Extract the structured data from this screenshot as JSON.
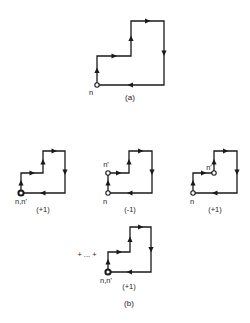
{
  "figure_a": {
    "caption": "(a)",
    "caption_pos": [
      130,
      100
    ],
    "path": [
      [
        97,
        85
      ],
      [
        97,
        56
      ],
      [
        131,
        56
      ],
      [
        131,
        21
      ],
      [
        164,
        21
      ],
      [
        164,
        85
      ],
      [
        97,
        85
      ]
    ],
    "nodes": [
      {
        "pos": [
          97,
          85
        ],
        "style": "normal",
        "label": "n",
        "label_pos": [
          91,
          95
        ]
      }
    ],
    "weight": null
  },
  "figure_b": {
    "caption": "(b)",
    "caption_pos": [
      129,
      306
    ],
    "ellipsis": "+ ... +",
    "ellipsis_pos": [
      87,
      257
    ],
    "panels": [
      {
        "path": [
          [
            21,
            193
          ],
          [
            21,
            173
          ],
          [
            43,
            173
          ],
          [
            43,
            151
          ],
          [
            65,
            151
          ],
          [
            65,
            193
          ],
          [
            21,
            193
          ]
        ],
        "nodes": [
          {
            "pos": [
              21,
              193
            ],
            "style": "bold",
            "label": "n,n'",
            "label_pos": [
              21,
              204
            ]
          }
        ],
        "weight": "(+1)",
        "weight_pos": [
          43,
          212
        ]
      },
      {
        "path": [
          [
            108,
            193
          ],
          [
            108,
            173
          ],
          [
            129,
            173
          ],
          [
            129,
            151
          ],
          [
            152,
            151
          ],
          [
            152,
            193
          ],
          [
            108,
            193
          ]
        ],
        "nodes": [
          {
            "pos": [
              108,
              193
            ],
            "style": "normal",
            "label": "n",
            "label_pos": [
              105,
              204
            ]
          },
          {
            "pos": [
              108,
              173
            ],
            "style": "normal",
            "label": "n'",
            "label_pos": [
              106,
              167
            ]
          }
        ],
        "weight": "(-1)",
        "weight_pos": [
          130,
          212
        ]
      },
      {
        "path": [
          [
            193,
            193
          ],
          [
            193,
            173
          ],
          [
            214,
            173
          ],
          [
            214,
            151
          ],
          [
            237,
            151
          ],
          [
            237,
            193
          ],
          [
            193,
            193
          ]
        ],
        "nodes": [
          {
            "pos": [
              193,
              193
            ],
            "style": "normal",
            "label": "n",
            "label_pos": [
              192,
              204
            ]
          },
          {
            "pos": [
              214,
              173
            ],
            "style": "normal",
            "label": "n'",
            "label_pos": [
              209,
              170
            ]
          }
        ],
        "weight": "(+1)",
        "weight_pos": [
          215,
          212
        ]
      },
      {
        "path": [
          [
            108,
            272
          ],
          [
            108,
            252
          ],
          [
            130,
            252
          ],
          [
            130,
            227
          ],
          [
            151,
            227
          ],
          [
            151,
            272
          ],
          [
            108,
            272
          ]
        ],
        "nodes": [
          {
            "pos": [
              108,
              272
            ],
            "style": "bold",
            "label": "n,n'",
            "label_pos": [
              106,
              283
            ]
          }
        ],
        "weight": "(+1)",
        "weight_pos": [
          129,
          289
        ]
      }
    ]
  }
}
